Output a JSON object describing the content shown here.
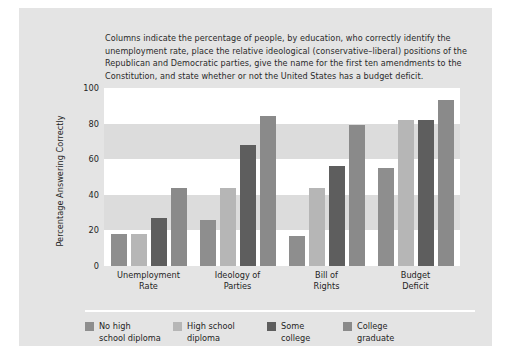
{
  "figure": {
    "caption": "Columns indicate the percentage of people, by education, who correctly identify the unemployment rate, place the relative ideological (conservative–liberal) positions of the Republican and Democratic parties, give the name for the first ten amendments to the Constitution, and state whether or not the United States has a budget deficit."
  },
  "chart_data": {
    "type": "bar",
    "title": "",
    "xlabel": "",
    "ylabel": "Percentage Answering Correctly",
    "ylim": [
      0,
      100
    ],
    "yticks": [
      0,
      20,
      40,
      60,
      80,
      100
    ],
    "ytick_labels": [
      "0",
      "20",
      "40",
      "60",
      "80",
      "100"
    ],
    "grid": "alternating horizontal bands",
    "legend_position": "bottom",
    "categories": [
      "Unemployment Rate",
      "Ideology of Parties",
      "Bill of Rights",
      "Budget Deficit"
    ],
    "category_lines": [
      [
        "Unemployment",
        "Rate"
      ],
      [
        "Ideology of",
        "Parties"
      ],
      [
        "Bill of",
        "Rights"
      ],
      [
        "Budget",
        "Deficit"
      ]
    ],
    "series": [
      {
        "name": "No high school diploma",
        "name_lines": [
          "No high",
          "school diploma"
        ],
        "color": "#8e8e8e",
        "values": [
          18,
          26,
          17,
          55
        ]
      },
      {
        "name": "High school diploma",
        "name_lines": [
          "High school",
          "diploma"
        ],
        "color": "#b6b6b6",
        "values": [
          18,
          44,
          44,
          82
        ]
      },
      {
        "name": "Some college",
        "name_lines": [
          "Some",
          "college"
        ],
        "color": "#5e5e5e",
        "values": [
          27,
          68,
          56,
          82
        ]
      },
      {
        "name": "College graduate",
        "name_lines": [
          "College",
          "graduate"
        ],
        "color": "#8a8a8a",
        "values": [
          44,
          84,
          79,
          93
        ]
      }
    ]
  },
  "colors": {
    "panel_background": "#e4e4e4",
    "plot_background": "#ffffff",
    "band": "#dcdcdc",
    "text": "#1f1f1f"
  }
}
